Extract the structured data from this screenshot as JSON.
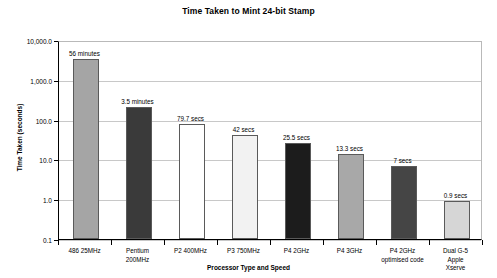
{
  "chart_data": {
    "type": "bar",
    "title": "Time Taken to Mint 24-bit Stamp",
    "xlabel": "Processor Type and Speed",
    "ylabel": "Time Taken (seconds)",
    "yscale": "log",
    "ylim": [
      0.1,
      10000
    ],
    "grid": true,
    "legend": "none",
    "categories": [
      "486 25MHz",
      "Pentium\n200MHz",
      "P2 400MHz",
      "P3 750MHz",
      "P4 2GHz",
      "P4 3GHz",
      "P4 2GHz\noptimised code",
      "Dual G-5 Apple\nXserve"
    ],
    "values": [
      3360,
      210,
      79.7,
      42,
      25.5,
      13.3,
      7,
      0.9
    ],
    "data_labels": [
      "56 minutes",
      "3.5 minutes",
      "79.7 secs",
      "42 secs",
      "25.5 secs",
      "13.3 secs",
      "7 secs",
      "0.9 secs"
    ],
    "bar_colors": [
      "#a5a5a5",
      "#3a3a3a",
      "#ffffff",
      "#f2f2f2",
      "#1c1c1c",
      "#a8a8a8",
      "#454545",
      "#d6d6d6"
    ],
    "ytick_labels": [
      "10,000.0",
      "1,000.0",
      "100.0",
      "10.0",
      "1.0",
      "0.1"
    ],
    "ytick_values": [
      10000,
      1000,
      100,
      10,
      1,
      0.1
    ]
  }
}
